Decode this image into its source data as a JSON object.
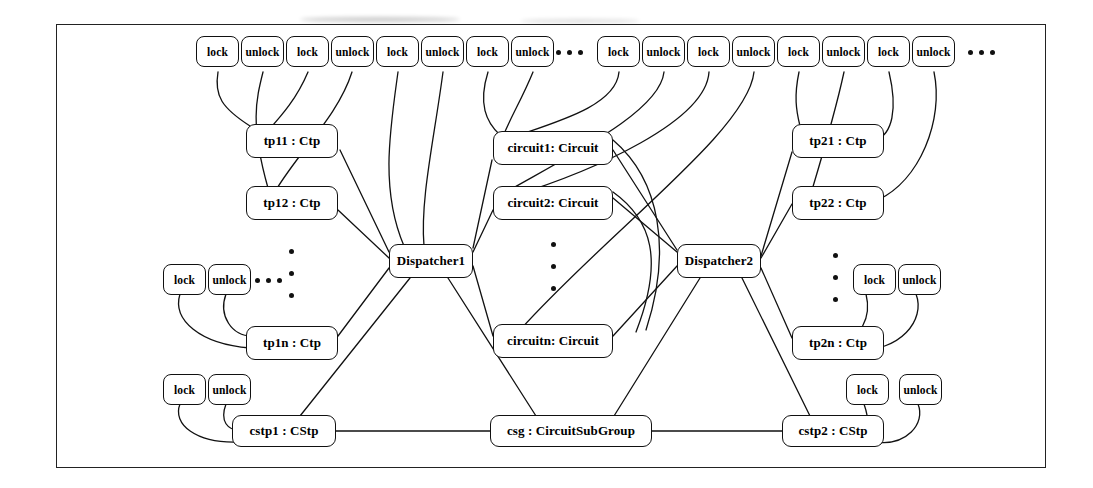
{
  "diagram": {
    "frame": {
      "x": 56,
      "y": 24,
      "width": 988,
      "height": 442
    },
    "stroke_color": "#111111",
    "background_color": "#ffffff"
  },
  "operations": {
    "lock_label": "lock",
    "unlock_label": "unlock",
    "ellipsis_label": "..."
  },
  "top_operations": [
    {
      "name": "op-lock-1",
      "label": "lock",
      "x": 196,
      "y": 36
    },
    {
      "name": "op-unlock-1",
      "label": "unlock",
      "x": 241,
      "y": 36
    },
    {
      "name": "op-lock-2",
      "label": "lock",
      "x": 286,
      "y": 36
    },
    {
      "name": "op-unlock-2",
      "label": "unlock",
      "x": 331,
      "y": 36
    },
    {
      "name": "op-lock-3",
      "label": "lock",
      "x": 376,
      "y": 36
    },
    {
      "name": "op-unlock-3",
      "label": "unlock",
      "x": 421,
      "y": 36
    },
    {
      "name": "op-lock-4",
      "label": "lock",
      "x": 466,
      "y": 36
    },
    {
      "name": "op-unlock-4",
      "label": "unlock",
      "x": 511,
      "y": 36
    },
    {
      "name": "op-lock-5",
      "label": "lock",
      "x": 597,
      "y": 36
    },
    {
      "name": "op-unlock-5",
      "label": "unlock",
      "x": 642,
      "y": 36
    },
    {
      "name": "op-lock-6",
      "label": "lock",
      "x": 687,
      "y": 36
    },
    {
      "name": "op-unlock-6",
      "label": "unlock",
      "x": 732,
      "y": 36
    },
    {
      "name": "op-lock-7",
      "label": "lock",
      "x": 777,
      "y": 36
    },
    {
      "name": "op-unlock-7",
      "label": "unlock",
      "x": 822,
      "y": 36
    },
    {
      "name": "op-lock-8",
      "label": "lock",
      "x": 867,
      "y": 36
    },
    {
      "name": "op-unlock-8",
      "label": "unlock",
      "x": 912,
      "y": 36
    }
  ],
  "top_ellipses": [
    {
      "name": "top-ellipsis-center",
      "x": 556,
      "y": 50
    },
    {
      "name": "top-ellipsis-right",
      "x": 968,
      "y": 50
    }
  ],
  "side_operations": [
    {
      "name": "op-lock-tp1n",
      "label": "lock",
      "x": 163,
      "y": 264
    },
    {
      "name": "op-unlock-tp1n",
      "label": "unlock",
      "x": 208,
      "y": 264
    },
    {
      "name": "op-lock-tp2n",
      "label": "lock",
      "x": 853,
      "y": 264
    },
    {
      "name": "op-unlock-tp2n",
      "label": "unlock",
      "x": 898,
      "y": 264
    },
    {
      "name": "op-lock-cstp1",
      "label": "lock",
      "x": 163,
      "y": 374
    },
    {
      "name": "op-unlock-cstp1",
      "label": "unlock",
      "x": 208,
      "y": 374
    },
    {
      "name": "op-lock-cstp2",
      "label": "lock",
      "x": 846,
      "y": 374
    },
    {
      "name": "op-unlock-cstp2",
      "label": "unlock",
      "x": 899,
      "y": 374
    }
  ],
  "side_ellipses": [
    {
      "name": "tp1n-ellipsis",
      "x": 255,
      "y": 278
    }
  ],
  "objects": [
    {
      "name": "object-tp11",
      "label": "tp11 : Ctp",
      "x": 246,
      "y": 124,
      "w": 92,
      "h": 34
    },
    {
      "name": "object-tp12",
      "label": "tp12 : Ctp",
      "x": 246,
      "y": 186,
      "w": 92,
      "h": 34
    },
    {
      "name": "object-tp1n",
      "label": "tp1n : Ctp",
      "x": 246,
      "y": 326,
      "w": 92,
      "h": 34
    },
    {
      "name": "object-tp21",
      "label": "tp21 : Ctp",
      "x": 792,
      "y": 124,
      "w": 92,
      "h": 34
    },
    {
      "name": "object-tp22",
      "label": "tp22 : Ctp",
      "x": 792,
      "y": 186,
      "w": 92,
      "h": 34
    },
    {
      "name": "object-tp2n",
      "label": "tp2n : Ctp",
      "x": 792,
      "y": 326,
      "w": 92,
      "h": 34
    },
    {
      "name": "object-circuit1",
      "label": "circuit1: Circuit",
      "x": 493,
      "y": 131,
      "w": 120,
      "h": 34
    },
    {
      "name": "object-circuit2",
      "label": "circuit2: Circuit",
      "x": 493,
      "y": 186,
      "w": 120,
      "h": 34
    },
    {
      "name": "object-circuitn",
      "label": "circuitn: Circuit",
      "x": 493,
      "y": 324,
      "w": 120,
      "h": 34
    },
    {
      "name": "object-dispatcher1",
      "label": "Dispatcher1",
      "x": 389,
      "y": 244,
      "w": 84,
      "h": 34
    },
    {
      "name": "object-dispatcher2",
      "label": "Dispatcher2",
      "x": 677,
      "y": 244,
      "w": 84,
      "h": 34
    },
    {
      "name": "object-cstp1",
      "label": "cstp1 : CStp",
      "x": 232,
      "y": 415,
      "w": 104,
      "h": 32
    },
    {
      "name": "object-csg",
      "label": "csg : CircuitSubGroup",
      "x": 490,
      "y": 415,
      "w": 162,
      "h": 32
    },
    {
      "name": "object-cstp2",
      "label": "cstp2 : CStp",
      "x": 782,
      "y": 415,
      "w": 102,
      "h": 32
    }
  ],
  "vertical_ellipses": [
    {
      "name": "tp1-column-ellipsis",
      "x": 289,
      "y": 249
    },
    {
      "name": "circuit-column-ellipsis",
      "x": 551,
      "y": 242
    },
    {
      "name": "tp2-column-ellipsis",
      "x": 833,
      "y": 253
    }
  ]
}
